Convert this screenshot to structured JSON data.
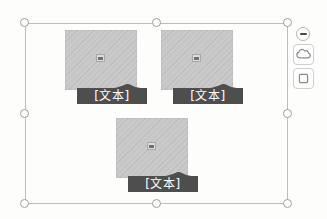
{
  "canvas": {
    "background": "#fdfdfc",
    "selected_object": "picture-grid-smartart",
    "handle_count": 8
  },
  "placeholders": [
    {
      "caption": "[文本]",
      "icon": "picture-icon",
      "position": "top-left"
    },
    {
      "caption": "[文本]",
      "icon": "picture-icon",
      "position": "top-right"
    },
    {
      "caption": "[文本]",
      "icon": "picture-icon",
      "position": "bottom-center"
    }
  ],
  "side_buttons": [
    {
      "name": "collapse",
      "icon": "minus-icon"
    },
    {
      "name": "shape",
      "icon": "cloud-shape-icon"
    },
    {
      "name": "frame",
      "icon": "square-icon"
    }
  ],
  "colors": {
    "canvas_bg": "#fdfdfc",
    "placeholder_fill": "#c8c8c8",
    "caption_bar": "#4e4e4e",
    "caption_text": "#ffffff",
    "selection_border": "#bdbdbd",
    "handle_fill": "#ffffff",
    "handle_border": "#9e9e9e",
    "icon_stroke": "#8a8a8a"
  }
}
